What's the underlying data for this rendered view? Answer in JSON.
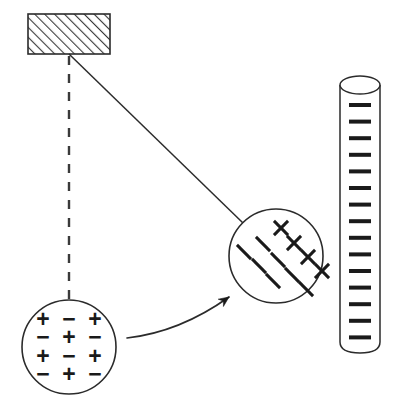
{
  "figure": {
    "type": "physics-diagram",
    "canvas": {
      "width": 396,
      "height": 418,
      "background": "#ffffff"
    },
    "stroke_color": "#2b2b2b",
    "glyph_color": "#1a1a1a"
  },
  "ceiling_block": {
    "label": "hatched support block",
    "x": 28,
    "y": 14,
    "width": 82,
    "height": 40,
    "hatch_direction": "lower-left to upper-right",
    "hatch_spacing": 7,
    "fill": "#ffffff"
  },
  "pivot": {
    "x": 69,
    "y": 54
  },
  "vertical_reference": {
    "label": "vertical dashed reference line",
    "x": 69,
    "y_start": 56,
    "y_end": 302,
    "dash": "9 9",
    "style": "dashed"
  },
  "string": {
    "label": "pendulum string",
    "x1": 69,
    "y1": 54,
    "x2": 243,
    "y2": 223,
    "style": "solid"
  },
  "sphere_neutral": {
    "label": "neutral sphere with alternating charges",
    "cx": 69,
    "cy": 347,
    "r": 47,
    "charge_rows": [
      [
        "+",
        "−",
        "+"
      ],
      [
        "−",
        "+",
        "−"
      ],
      [
        "+",
        "−",
        "+"
      ],
      [
        "−",
        "+",
        "−"
      ]
    ],
    "col_x": [
      -26,
      0,
      26
    ],
    "row_y": [
      -28,
      -10,
      9,
      27
    ],
    "glyph_size": 23
  },
  "sphere_charged": {
    "label": "charged sphere with polarized charges",
    "cx": 276,
    "cy": 256,
    "r": 47,
    "tilt_degrees": 45,
    "positive_marks": [
      {
        "dx": 5,
        "dy": -28
      },
      {
        "dx": 18,
        "dy": -13
      },
      {
        "dx": 32,
        "dy": 1
      },
      {
        "dx": 46,
        "dy": 15
      }
    ],
    "negative_marks": [
      {
        "dx": -32,
        "dy": -4
      },
      {
        "dx": -17,
        "dy": 10
      },
      {
        "dx": -3,
        "dy": 25
      },
      {
        "dx": -13,
        "dy": -12
      },
      {
        "dx": 2,
        "dy": 4
      },
      {
        "dx": 16,
        "dy": 19
      },
      {
        "dx": 30,
        "dy": 33
      }
    ],
    "positive_size": 20,
    "negative_size": 20
  },
  "attraction_arrow": {
    "label": "curved attraction arrow",
    "start": {
      "x": 127,
      "y": 338
    },
    "control": {
      "x": 180,
      "y": 332
    },
    "end": {
      "x": 229,
      "y": 297
    },
    "arrowhead_size": 11,
    "direction": "toward charged sphere"
  },
  "charged_rod": {
    "label": "charged rod cylinder with tick marks",
    "x": 340,
    "y_top": 85,
    "width": 40,
    "height": 268,
    "ellipse_ry": 9,
    "tick_count": 15,
    "tick_first_y": 105,
    "tick_spacing": 16.6,
    "tick_width": 22,
    "tick_thickness": 4
  }
}
